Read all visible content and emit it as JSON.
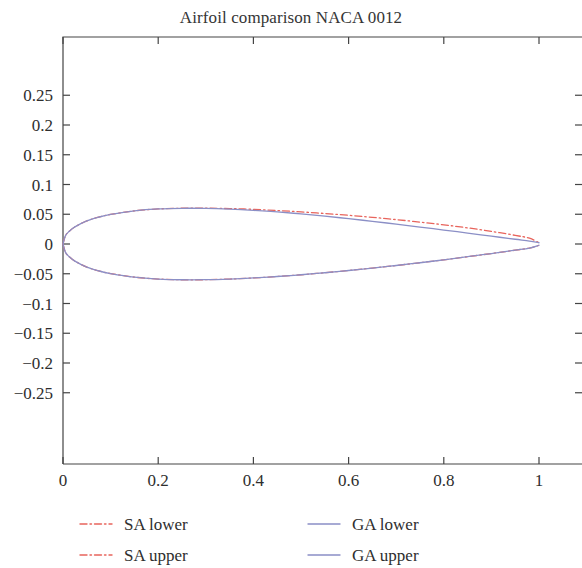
{
  "chart_data": {
    "type": "line",
    "title": "Airfoil comparison NACA 0012",
    "xlabel": "",
    "ylabel": "",
    "xlim": [
      0,
      1.1
    ],
    "ylim": [
      -0.28,
      0.28
    ],
    "grid": false,
    "legend_position": "bottom",
    "xticks": [
      "0",
      "0.2",
      "0.4",
      "0.6",
      "0.8",
      "1"
    ],
    "xtick_values": [
      0,
      0.2,
      0.4,
      0.6,
      0.8,
      1
    ],
    "yticks": [
      "0.25",
      "0.2",
      "0.15",
      "0.1",
      "0.05",
      "0",
      "-0.05",
      "-0.1",
      "-0.15",
      "-0.2",
      "-0.25"
    ],
    "ytick_values": [
      0.25,
      0.2,
      0.15,
      0.1,
      0.05,
      0,
      -0.05,
      -0.1,
      -0.15,
      -0.2,
      -0.25
    ],
    "colors": {
      "sa": "#e8645c",
      "ga": "#8b8fc6",
      "axis": "#444444",
      "text": "#2e2e2e"
    },
    "series": [
      {
        "name": "SA lower",
        "style": "dashdot",
        "color": "#e8645c",
        "x": [
          0.0,
          0.005,
          0.0125,
          0.025,
          0.05,
          0.075,
          0.1,
          0.15,
          0.2,
          0.25,
          0.3,
          0.35,
          0.4,
          0.45,
          0.5,
          0.55,
          0.6,
          0.65,
          0.7,
          0.75,
          0.8,
          0.85,
          0.9,
          0.95,
          0.98,
          1.0
        ],
        "y": [
          0.0,
          -0.0137,
          -0.0209,
          -0.0287,
          -0.0388,
          -0.0452,
          -0.0497,
          -0.0557,
          -0.0589,
          -0.0601,
          -0.06,
          -0.0589,
          -0.0571,
          -0.0546,
          -0.0517,
          -0.0483,
          -0.0445,
          -0.0404,
          -0.0361,
          -0.0315,
          -0.0266,
          -0.0214,
          -0.016,
          -0.0104,
          -0.0068,
          -0.0021
        ]
      },
      {
        "name": "SA upper",
        "style": "dashdot",
        "color": "#e8645c",
        "x": [
          0.0,
          0.005,
          0.0125,
          0.025,
          0.05,
          0.075,
          0.1,
          0.15,
          0.2,
          0.25,
          0.3,
          0.35,
          0.4,
          0.45,
          0.5,
          0.55,
          0.6,
          0.65,
          0.7,
          0.75,
          0.8,
          0.85,
          0.9,
          0.95,
          0.98,
          1.0
        ],
        "y": [
          0.0,
          0.0137,
          0.0209,
          0.0287,
          0.0388,
          0.0452,
          0.0497,
          0.0557,
          0.0589,
          0.0601,
          0.0602,
          0.0595,
          0.0582,
          0.0563,
          0.054,
          0.0513,
          0.0482,
          0.0448,
          0.041,
          0.0368,
          0.0322,
          0.0271,
          0.0213,
          0.0145,
          0.0097,
          0.0021
        ]
      },
      {
        "name": "GA lower",
        "style": "solid",
        "color": "#8b8fc6",
        "x": [
          0.0,
          0.005,
          0.0125,
          0.025,
          0.05,
          0.075,
          0.1,
          0.15,
          0.2,
          0.25,
          0.3,
          0.35,
          0.4,
          0.45,
          0.5,
          0.55,
          0.6,
          0.65,
          0.7,
          0.75,
          0.8,
          0.85,
          0.9,
          0.95,
          0.98,
          1.0
        ],
        "y": [
          0.0,
          -0.0137,
          -0.0209,
          -0.0287,
          -0.0388,
          -0.0452,
          -0.0497,
          -0.0557,
          -0.0589,
          -0.0601,
          -0.06,
          -0.0589,
          -0.0571,
          -0.0546,
          -0.0517,
          -0.0483,
          -0.0445,
          -0.0404,
          -0.0361,
          -0.0315,
          -0.0266,
          -0.0214,
          -0.016,
          -0.0104,
          -0.0068,
          -0.0021
        ]
      },
      {
        "name": "GA upper",
        "style": "solid",
        "color": "#8b8fc6",
        "x": [
          0.0,
          0.005,
          0.0125,
          0.025,
          0.05,
          0.075,
          0.1,
          0.15,
          0.2,
          0.25,
          0.3,
          0.35,
          0.4,
          0.45,
          0.5,
          0.55,
          0.6,
          0.65,
          0.7,
          0.75,
          0.8,
          0.85,
          0.9,
          0.95,
          0.98,
          1.0
        ],
        "y": [
          0.0,
          0.0137,
          0.0209,
          0.0287,
          0.0388,
          0.0452,
          0.0497,
          0.0557,
          0.0589,
          0.06,
          0.0598,
          0.0586,
          0.0566,
          0.0539,
          0.0506,
          0.0468,
          0.0426,
          0.0381,
          0.0334,
          0.0285,
          0.0235,
          0.0184,
          0.0132,
          0.008,
          0.005,
          0.0021
        ]
      }
    ]
  },
  "legend": {
    "entries": [
      {
        "label": "SA lower",
        "style": "dashdot",
        "color": "#e8645c"
      },
      {
        "label": "GA lower",
        "style": "solid",
        "color": "#8b8fc6"
      },
      {
        "label": "SA upper",
        "style": "dashdot",
        "color": "#e8645c"
      },
      {
        "label": "GA upper",
        "style": "solid",
        "color": "#8b8fc6"
      }
    ]
  }
}
